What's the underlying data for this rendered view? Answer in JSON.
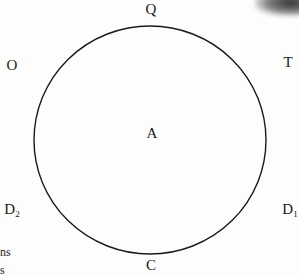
{
  "diagram": {
    "type": "circle-with-points",
    "circle": {
      "cx": 150,
      "cy": 140,
      "rx": 116,
      "ry": 114,
      "stroke": "#1a1a1a",
      "stroke_width": 1.4
    },
    "center_label": {
      "text": "A",
      "x": 152,
      "y": 133
    },
    "points": [
      {
        "id": "Q",
        "base": "Q",
        "sub": "",
        "x": 151,
        "y": 10
      },
      {
        "id": "O",
        "base": "O",
        "sub": "",
        "x": 12,
        "y": 66
      },
      {
        "id": "T",
        "base": "T",
        "sub": "",
        "x": 288,
        "y": 63
      },
      {
        "id": "D2",
        "base": "D",
        "sub": "2",
        "x": 12,
        "y": 210
      },
      {
        "id": "D1",
        "base": "D",
        "sub": "1",
        "x": 290,
        "y": 210
      },
      {
        "id": "C",
        "base": "C",
        "sub": "",
        "x": 151,
        "y": 266
      }
    ]
  },
  "cropped_margin_text": [
    {
      "text": "ns",
      "x": 0,
      "y": 246
    },
    {
      "text": "s",
      "x": 0,
      "y": 264
    }
  ]
}
